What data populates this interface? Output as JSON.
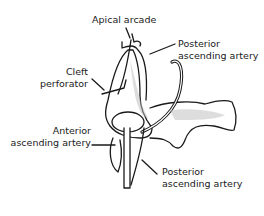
{
  "diagram": {
    "type": "anatomical-illustration",
    "labels": {
      "apical_arcade": "Apical arcade",
      "posterior_ascending_artery_top_1": "Posterior",
      "posterior_ascending_artery_top_2": "ascending artery",
      "cleft_perforator_1": "Cleft",
      "cleft_perforator_2": "perforator",
      "anterior_ascending_artery_1": "Anterior",
      "anterior_ascending_artery_2": "ascending artery",
      "posterior_ascending_artery_bottom_1": "Posterior",
      "posterior_ascending_artery_bottom_2": "ascending artery"
    },
    "colors": {
      "ink": "#1a1a1a",
      "background": "#ffffff",
      "shade": "#bdbdbd"
    }
  }
}
